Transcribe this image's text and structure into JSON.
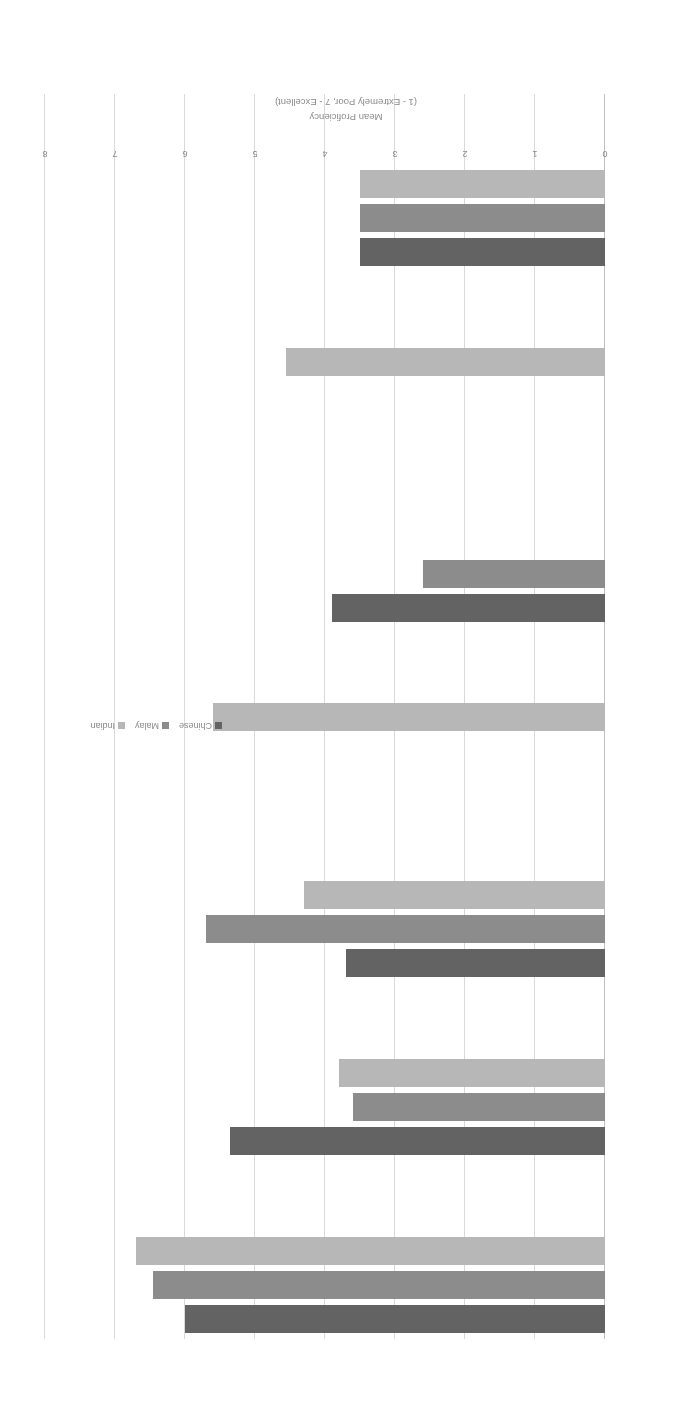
{
  "chart_data": {
    "type": "bar",
    "orientation": "horizontal",
    "title": "",
    "xlabel": "",
    "ylabel": "Mean Proficiency (1 - Extremely Poor, 7 - Excellent)",
    "axis_title_line1": "Mean Proficiency",
    "axis_title_line2": "(1 - Extremely Poor, 7 - Excellent)",
    "categories": [
      "English",
      "Mandarin",
      "Malay",
      "Tamil",
      "“Dialects”",
      "NTIL",
      "Interest language"
    ],
    "series": [
      {
        "name": "Chinese",
        "color": "#636363",
        "values": [
          6.0,
          5.35,
          3.7,
          null,
          3.9,
          null,
          3.5
        ]
      },
      {
        "name": "Malay",
        "color": "#8c8c8c",
        "values": [
          6.45,
          3.6,
          5.7,
          null,
          2.6,
          null,
          3.5
        ]
      },
      {
        "name": "Indian",
        "color": "#b7b7b7",
        "values": [
          6.7,
          3.8,
          4.3,
          5.6,
          null,
          4.55,
          3.5
        ]
      }
    ],
    "xlim": [
      0,
      8
    ],
    "ticks": [
      "0",
      "1",
      "2",
      "3",
      "4",
      "5",
      "6",
      "7",
      "8"
    ],
    "grid": true,
    "legend_position": "middle-right",
    "rotation_degrees": 180
  },
  "legend": {
    "items": [
      {
        "label": "Chinese",
        "color": "#636363"
      },
      {
        "label": "Malay",
        "color": "#8c8c8c"
      },
      {
        "label": "Indian",
        "color": "#b7b7b7"
      }
    ]
  }
}
